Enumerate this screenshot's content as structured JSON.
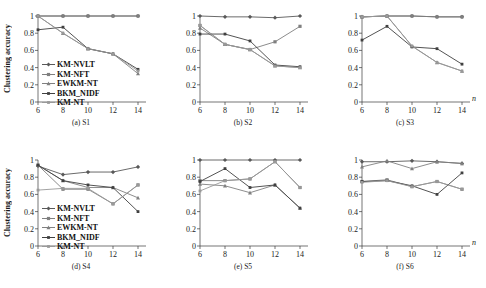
{
  "figure": {
    "axis_label_y": "Clustering accuracy",
    "axis_label_x": "n",
    "y_ticks": [
      "0",
      "0.2",
      "0.4",
      "0.6",
      "0.8",
      "1"
    ],
    "x_ticks": [
      "6",
      "8",
      "10",
      "12",
      "14"
    ]
  },
  "legend": {
    "entries": [
      {
        "label": "KM-NVLT",
        "color": "#595959",
        "marker": "diamond"
      },
      {
        "label": "KM-NFT",
        "color": "#7f7f7f",
        "marker": "square"
      },
      {
        "label": "EWKM-NT",
        "color": "#808080",
        "marker": "triangle"
      },
      {
        "label": "BKM_NIDF",
        "color": "#404040",
        "marker": "line"
      },
      {
        "label": "KM-NT",
        "color": "#999999",
        "marker": "line"
      }
    ]
  },
  "chart_data": [
    {
      "type": "line",
      "title": "(a) S1",
      "xlabel": "n",
      "ylabel": "Clustering accuracy",
      "x": [
        6,
        8,
        10,
        12,
        14
      ],
      "ylim": [
        0,
        1
      ],
      "xlim": [
        6,
        14
      ],
      "grid": false,
      "legend_position": "inside-left",
      "series": [
        {
          "name": "KM-NVLT",
          "values": [
            1.0,
            1.0,
            1.0,
            1.0,
            1.0
          ],
          "color": "#595959"
        },
        {
          "name": "KM-NFT",
          "values": [
            1.0,
            1.0,
            1.0,
            1.0,
            1.0
          ],
          "color": "#7f7f7f"
        },
        {
          "name": "EWKM-NT",
          "values": [
            1.0,
            0.8,
            0.62,
            0.56,
            0.33
          ],
          "color": "#808080"
        },
        {
          "name": "BKM_NIDF",
          "values": [
            0.84,
            0.87,
            0.62,
            0.56,
            0.38
          ],
          "color": "#404040"
        },
        {
          "name": "KM-NT",
          "values": [
            1.0,
            0.8,
            0.62,
            0.56,
            0.36
          ],
          "color": "#999999"
        }
      ]
    },
    {
      "type": "line",
      "title": "(b) S2",
      "xlabel": "n",
      "ylabel": "Clustering accuracy",
      "x": [
        6,
        8,
        10,
        12,
        14
      ],
      "ylim": [
        0,
        1
      ],
      "xlim": [
        6,
        14
      ],
      "grid": false,
      "legend_position": "none",
      "series": [
        {
          "name": "KM-NVLT",
          "values": [
            1.0,
            0.99,
            0.99,
            0.98,
            1.0
          ],
          "color": "#595959"
        },
        {
          "name": "KM-NFT",
          "values": [
            0.89,
            0.67,
            0.61,
            0.7,
            0.88
          ],
          "color": "#7f7f7f"
        },
        {
          "name": "EWKM-NT",
          "values": [
            0.86,
            0.67,
            0.61,
            0.42,
            0.4
          ],
          "color": "#808080"
        },
        {
          "name": "BKM_NIDF",
          "values": [
            0.79,
            0.79,
            0.71,
            0.43,
            0.41
          ],
          "color": "#404040"
        },
        {
          "name": "KM-NT",
          "values": [
            0.89,
            0.67,
            0.61,
            0.42,
            0.4
          ],
          "color": "#999999"
        }
      ]
    },
    {
      "type": "line",
      "title": "(c) S3",
      "xlabel": "n",
      "ylabel": "Clustering accuracy",
      "x": [
        6,
        8,
        10,
        12,
        14
      ],
      "ylim": [
        0,
        1
      ],
      "xlim": [
        6,
        14
      ],
      "grid": false,
      "legend_position": "none",
      "series": [
        {
          "name": "KM-NVLT",
          "values": [
            0.99,
            1.0,
            1.0,
            0.99,
            0.99
          ],
          "color": "#595959"
        },
        {
          "name": "KM-NFT",
          "values": [
            0.99,
            1.0,
            1.0,
            0.99,
            0.99
          ],
          "color": "#7f7f7f"
        },
        {
          "name": "EWKM-NT",
          "values": [
            0.99,
            1.0,
            0.65,
            0.46,
            0.36
          ],
          "color": "#808080"
        },
        {
          "name": "BKM_NIDF",
          "values": [
            0.72,
            0.88,
            0.64,
            0.62,
            0.44
          ],
          "color": "#404040"
        },
        {
          "name": "KM-NT",
          "values": [
            0.99,
            1.0,
            0.65,
            0.46,
            0.36
          ],
          "color": "#999999"
        }
      ]
    },
    {
      "type": "line",
      "title": "(d) S4",
      "xlabel": "n",
      "ylabel": "Clustering accuracy",
      "x": [
        6,
        8,
        10,
        12,
        14
      ],
      "ylim": [
        0,
        1
      ],
      "xlim": [
        6,
        14
      ],
      "grid": false,
      "legend_position": "inside-left",
      "series": [
        {
          "name": "KM-NVLT",
          "values": [
            0.93,
            0.83,
            0.86,
            0.86,
            0.92
          ],
          "color": "#595959"
        },
        {
          "name": "KM-NFT",
          "values": [
            0.94,
            0.66,
            0.66,
            0.49,
            0.71
          ],
          "color": "#7f7f7f"
        },
        {
          "name": "EWKM-NT",
          "values": [
            0.94,
            0.76,
            0.68,
            0.68,
            0.56
          ],
          "color": "#808080"
        },
        {
          "name": "BKM_NIDF",
          "values": [
            0.94,
            0.76,
            0.71,
            0.68,
            0.4
          ],
          "color": "#404040"
        },
        {
          "name": "KM-NT",
          "values": [
            0.65,
            0.67,
            0.67,
            0.49,
            0.71
          ],
          "color": "#999999"
        }
      ]
    },
    {
      "type": "line",
      "title": "(e) S5",
      "xlabel": "n",
      "ylabel": "Clustering accuracy",
      "x": [
        6,
        8,
        10,
        12,
        14
      ],
      "ylim": [
        0,
        1
      ],
      "xlim": [
        6,
        14
      ],
      "grid": false,
      "legend_position": "none",
      "series": [
        {
          "name": "KM-NVLT",
          "values": [
            1.0,
            1.0,
            1.0,
            1.0,
            1.0
          ],
          "color": "#595959"
        },
        {
          "name": "KM-NFT",
          "values": [
            0.76,
            0.76,
            0.78,
            0.98,
            0.68
          ],
          "color": "#7f7f7f"
        },
        {
          "name": "EWKM-NT",
          "values": [
            0.72,
            0.7,
            0.62,
            0.71,
            0.44
          ],
          "color": "#808080"
        },
        {
          "name": "BKM_NIDF",
          "values": [
            0.75,
            0.9,
            0.68,
            0.71,
            0.44
          ],
          "color": "#404040"
        },
        {
          "name": "KM-NT",
          "values": [
            0.64,
            0.76,
            0.78,
            0.98,
            0.68
          ],
          "color": "#999999"
        }
      ]
    },
    {
      "type": "line",
      "title": "(f) S6",
      "xlabel": "n",
      "ylabel": "Clustering accuracy",
      "x": [
        6,
        8,
        10,
        12,
        14
      ],
      "ylim": [
        0,
        1
      ],
      "xlim": [
        6,
        14
      ],
      "grid": false,
      "legend_position": "none",
      "series": [
        {
          "name": "KM-NVLT",
          "values": [
            0.98,
            0.98,
            0.99,
            0.98,
            0.96
          ],
          "color": "#595959"
        },
        {
          "name": "KM-NFT",
          "values": [
            0.75,
            0.77,
            0.69,
            0.75,
            0.66
          ],
          "color": "#7f7f7f"
        },
        {
          "name": "EWKM-NT",
          "values": [
            0.92,
            0.99,
            0.9,
            0.98,
            0.96
          ],
          "color": "#808080"
        },
        {
          "name": "BKM_NIDF",
          "values": [
            0.75,
            0.76,
            0.7,
            0.6,
            0.85
          ],
          "color": "#404040"
        },
        {
          "name": "KM-NT",
          "values": [
            0.74,
            0.76,
            0.69,
            0.75,
            0.66
          ],
          "color": "#999999"
        }
      ]
    }
  ]
}
